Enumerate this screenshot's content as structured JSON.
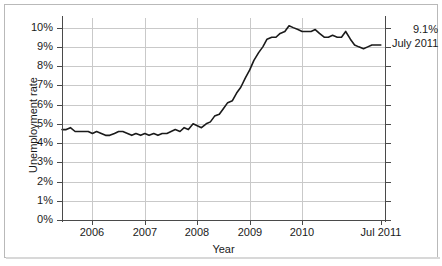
{
  "chart_data": {
    "type": "line",
    "title": "",
    "xlabel": "Year",
    "ylabel": "Unemployment rate",
    "ylim": [
      0,
      10.5
    ],
    "xlim": [
      2005.42,
      2011.58
    ],
    "grid": true,
    "legend": false,
    "y_tick_labels": [
      "0%",
      "1%",
      "2%",
      "3%",
      "4%",
      "5%",
      "6%",
      "7%",
      "8%",
      "9%",
      "10%"
    ],
    "y_tick_values": [
      0,
      1,
      2,
      3,
      4,
      5,
      6,
      7,
      8,
      9,
      10
    ],
    "x_tick_labels": [
      "2006",
      "2007",
      "2008",
      "2009",
      "2010",
      "Jul 2011"
    ],
    "x_tick_values": [
      2006,
      2007,
      2008,
      2009,
      2010,
      2011.5
    ],
    "series": [
      {
        "name": "Unemployment rate",
        "color": "#1a1a1a",
        "x": [
          2005.42,
          2005.5,
          2005.58,
          2005.67,
          2005.75,
          2005.83,
          2005.92,
          2006.0,
          2006.08,
          2006.17,
          2006.25,
          2006.33,
          2006.42,
          2006.5,
          2006.58,
          2006.67,
          2006.75,
          2006.83,
          2006.92,
          2007.0,
          2007.08,
          2007.17,
          2007.25,
          2007.33,
          2007.42,
          2007.5,
          2007.58,
          2007.67,
          2007.75,
          2007.83,
          2007.92,
          2008.0,
          2008.08,
          2008.17,
          2008.25,
          2008.33,
          2008.42,
          2008.5,
          2008.58,
          2008.67,
          2008.75,
          2008.83,
          2008.92,
          2009.0,
          2009.08,
          2009.17,
          2009.25,
          2009.33,
          2009.42,
          2009.5,
          2009.58,
          2009.67,
          2009.75,
          2009.83,
          2009.92,
          2010.0,
          2010.08,
          2010.17,
          2010.25,
          2010.33,
          2010.42,
          2010.5,
          2010.58,
          2010.67,
          2010.75,
          2010.83,
          2010.92,
          2011.0,
          2011.08,
          2011.17,
          2011.25,
          2011.33,
          2011.42,
          2011.5
        ],
        "values": [
          4.7,
          4.7,
          4.8,
          4.6,
          4.6,
          4.6,
          4.6,
          4.5,
          4.6,
          4.5,
          4.4,
          4.4,
          4.5,
          4.6,
          4.6,
          4.5,
          4.4,
          4.5,
          4.4,
          4.5,
          4.4,
          4.5,
          4.4,
          4.5,
          4.5,
          4.6,
          4.7,
          4.6,
          4.8,
          4.7,
          5.0,
          4.9,
          4.8,
          5.0,
          5.1,
          5.4,
          5.5,
          5.8,
          6.1,
          6.2,
          6.6,
          6.9,
          7.4,
          7.8,
          8.3,
          8.7,
          9.0,
          9.4,
          9.5,
          9.5,
          9.7,
          9.8,
          10.1,
          10.0,
          9.9,
          9.8,
          9.8,
          9.8,
          9.9,
          9.7,
          9.5,
          9.5,
          9.6,
          9.5,
          9.5,
          9.8,
          9.4,
          9.1,
          9.0,
          8.9,
          9.0,
          9.1,
          9.1,
          9.1
        ]
      }
    ],
    "annotations": [
      {
        "value_label": "9.1%",
        "date_label": "July 2011",
        "x": 2011.5,
        "y": 9.1
      }
    ]
  },
  "axes": {
    "y_title": "Unemployment rate",
    "x_title": "Year"
  },
  "annotation": {
    "value": "9.1%",
    "date": "July 2011"
  }
}
